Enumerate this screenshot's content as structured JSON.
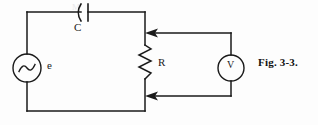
{
  "figure": {
    "caption": "Fig. 3-3.",
    "background_color": "#fdfdfd",
    "ink_color": "#1a1a1a",
    "width": 318,
    "height": 125
  },
  "circuit": {
    "title": "Fig. 3-3.",
    "description": "Series AC circuit: sinusoidal source e drives capacitor C and resistor R; a voltmeter V is connected in parallel across R.",
    "components": [
      {
        "id": "source",
        "type": "ac-voltage-source",
        "label": "e",
        "symbol": "circle-with-sine",
        "position": "left-branch"
      },
      {
        "id": "capacitor",
        "type": "capacitor",
        "label": "C",
        "symbol": "curved-plate-capacitor",
        "position": "top-branch"
      },
      {
        "id": "resistor",
        "type": "resistor",
        "label": "R",
        "symbol": "zigzag",
        "position": "right-branch"
      },
      {
        "id": "voltmeter",
        "type": "voltmeter",
        "label": "V",
        "symbol": "circle-with-letter",
        "position": "measurement-branch"
      }
    ],
    "leads": [
      {
        "id": "voltmeter-lead-top",
        "arrow": "left",
        "connects": "voltmeter to resistor top node"
      },
      {
        "id": "voltmeter-lead-bottom",
        "arrow": "left",
        "connects": "voltmeter to resistor bottom node"
      }
    ]
  },
  "labels": {
    "capacitor": "C",
    "source": "e",
    "resistor": "R",
    "voltmeter": "V"
  },
  "page_bleed": {
    "line1": "M",
    "line2": "",
    "line3": ""
  }
}
